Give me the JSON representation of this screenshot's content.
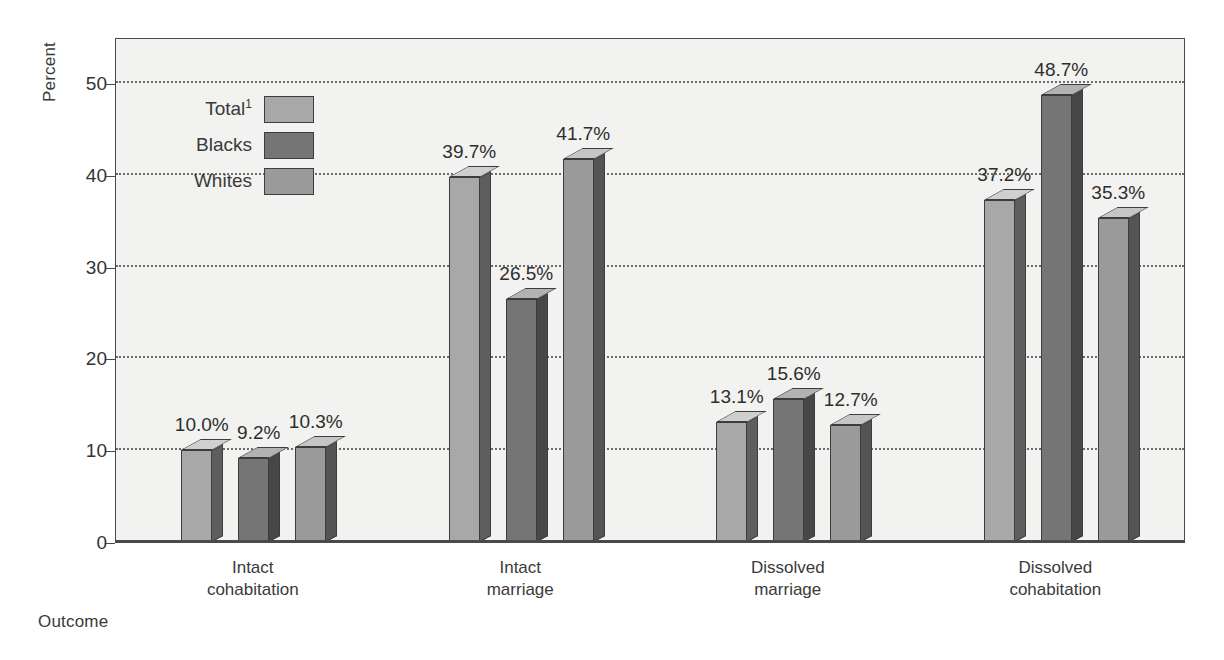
{
  "chart_data": {
    "type": "bar",
    "title": "",
    "subtitle": "",
    "xlabel": "Outcome",
    "ylabel": "Percent",
    "ylim": [
      0,
      55
    ],
    "yticks": [
      0,
      10,
      20,
      30,
      40,
      50
    ],
    "ytick_labels": [
      "0",
      "10",
      "20",
      "30",
      "40",
      "50"
    ],
    "grid": true,
    "grid_axis": "y",
    "grid_style": "dotted",
    "legend_position": "inside-upper-left",
    "value_label_suffix": "%",
    "categories": [
      "Intact\ncohabitation",
      "Intact\nmarriage",
      "Dissolved\nmarriage",
      "Dissolved\ncohabitation"
    ],
    "series": [
      {
        "name": "Total",
        "name_footnote": "1",
        "color": "#a8a8a8",
        "side_color": "#5e5e5e",
        "top_color": "#cfcfcf",
        "values": [
          10.0,
          39.7,
          13.1,
          37.2
        ],
        "value_labels": [
          "10.0%",
          "39.7%",
          "13.1%",
          "37.2%"
        ]
      },
      {
        "name": "Blacks",
        "name_footnote": "",
        "color": "#757575",
        "side_color": "#474747",
        "top_color": "#b2b2b2",
        "values": [
          9.2,
          26.5,
          15.6,
          48.7
        ],
        "value_labels": [
          "9.2%",
          "26.5%",
          "15.6%",
          "48.7%"
        ]
      },
      {
        "name": "Whites",
        "name_footnote": "",
        "color": "#9a9a9a",
        "side_color": "#545454",
        "top_color": "#c6c6c6",
        "values": [
          10.3,
          41.7,
          12.7,
          35.3
        ],
        "value_labels": [
          "10.3%",
          "41.7%",
          "12.7%",
          "35.3%"
        ]
      }
    ]
  },
  "legend": {
    "items": [
      {
        "label": "Total",
        "footnote": "1"
      },
      {
        "label": "Blacks",
        "footnote": ""
      },
      {
        "label": "Whites",
        "footnote": ""
      }
    ]
  },
  "axes": {
    "y_title": "Percent",
    "x_title": "Outcome"
  },
  "colors": {
    "plot_background": "#f2f2f0",
    "frame": "#4a4a4a",
    "gridline": "#6b6b6b",
    "text": "#333333"
  }
}
